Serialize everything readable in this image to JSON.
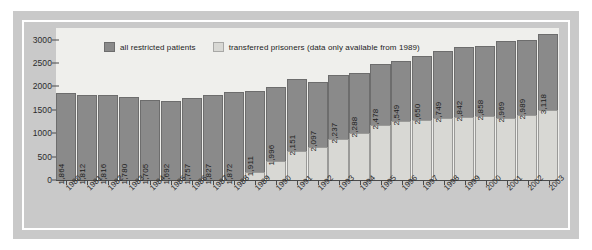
{
  "chart_data": {
    "type": "bar",
    "title": "",
    "subtitle": "",
    "xlabel": "",
    "ylabel": "",
    "stacked": true,
    "grid": false,
    "legend_position": "top-left",
    "ylim": [
      0,
      3250
    ],
    "yticks": [
      0,
      500,
      1000,
      1500,
      2000,
      2500,
      3000
    ],
    "ytick_labels": [
      "0",
      "500",
      "1000",
      "1500",
      "2000",
      "2500",
      "3000"
    ],
    "categories": [
      "1980",
      "1981",
      "1982",
      "1983",
      "1984",
      "1985",
      "1986",
      "1987",
      "1988",
      "1989",
      "1990",
      "1991",
      "1992",
      "1993",
      "1994",
      "1995",
      "1996",
      "1997",
      "1998",
      "1999",
      "2000",
      "2001",
      "2002",
      "2003"
    ],
    "series": [
      {
        "name": "all restricted patients",
        "color": "#8a8a8a",
        "values": [
          1864,
          1812,
          1816,
          1780,
          1705,
          1692,
          1757,
          1827,
          1872,
          1911,
          1996,
          2151,
          2097,
          2237,
          2288,
          2478,
          2549,
          2650,
          2749,
          2842,
          2858,
          2969,
          2989,
          3118
        ]
      },
      {
        "name": "transferred prisoners (data only available from 1989)",
        "color": "#d8d8d4",
        "values": [
          null,
          null,
          null,
          null,
          null,
          null,
          null,
          null,
          null,
          180,
          400,
          620,
          700,
          880,
          1000,
          1180,
          1260,
          1280,
          1320,
          1340,
          1360,
          1330,
          1400,
          1500
        ]
      }
    ],
    "bar_value_labels": [
      "1,864",
      "1,812",
      "1,816",
      "1,780",
      "1,705",
      "1,692",
      "1,757",
      "1,827",
      "1,872",
      "1,911",
      "1,996",
      "2,151",
      "2,097",
      "2,237",
      "2,288",
      "2,478",
      "2,549",
      "2,650",
      "2,749",
      "2,842",
      "2,858",
      "2,969",
      "2,989",
      "3,118"
    ]
  },
  "legend": {
    "entries": [
      {
        "label": "all restricted patients",
        "swatch": "dark-grey-swatch"
      },
      {
        "label": "transferred prisoners (data only available from 1989)",
        "swatch": "light-grey-swatch"
      }
    ]
  },
  "colors": {
    "bar_dark": "#8a8a8a",
    "bar_light": "#d8d8d4",
    "plot_background": "#efefec",
    "frame": "#c9c9c9",
    "axis": "#4a4a4a"
  }
}
